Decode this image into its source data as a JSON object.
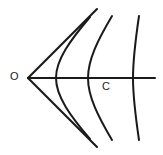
{
  "figure": {
    "kind": "line-diagram",
    "background_color": "#ffffff",
    "stroke_color": "#1a1a1a",
    "width": 163,
    "height": 155,
    "labels": {
      "origin": "O",
      "center": "C"
    },
    "geometry": {
      "apex": {
        "x": 28,
        "y": 78
      },
      "axis": {
        "x1": 28,
        "y1": 78,
        "x2": 155,
        "y2": 78
      },
      "cone_upper": {
        "x1": 28,
        "y1": 78,
        "x2": 97,
        "y2": 9
      },
      "cone_lower": {
        "x1": 28,
        "y1": 78,
        "x2": 97,
        "y2": 147
      },
      "arcs": [
        {
          "name": "arc-1",
          "axis_crossing_x": 56,
          "top_x": 90,
          "top_y": 17,
          "bottom_x": 90,
          "bottom_y": 139
        },
        {
          "name": "arc-2",
          "axis_crossing_x": 88,
          "top_x": 112,
          "top_y": 16,
          "bottom_x": 112,
          "bottom_y": 140
        },
        {
          "name": "arc-3",
          "axis_crossing_x": 133,
          "top_x": 139,
          "top_y": 16,
          "bottom_x": 139,
          "bottom_y": 140
        }
      ]
    }
  }
}
